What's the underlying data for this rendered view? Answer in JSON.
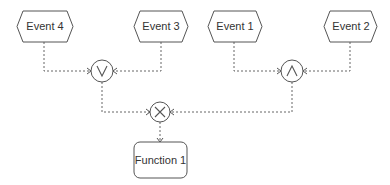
{
  "diagram": {
    "type": "EPC (Event-driven Process Chain)",
    "events": [
      {
        "id": "event4",
        "label": "Event 4"
      },
      {
        "id": "event3",
        "label": "Event 3"
      },
      {
        "id": "event1",
        "label": "Event 1"
      },
      {
        "id": "event2",
        "label": "Event 2"
      }
    ],
    "connectors": [
      {
        "id": "or",
        "symbol": "∨",
        "kind": "OR",
        "inputs": [
          "event4",
          "event3"
        ]
      },
      {
        "id": "and",
        "symbol": "∧",
        "kind": "AND",
        "inputs": [
          "event1",
          "event2"
        ]
      },
      {
        "id": "xor",
        "symbol": "×",
        "kind": "XOR",
        "inputs": [
          "or",
          "and"
        ]
      }
    ],
    "functions": [
      {
        "id": "function1",
        "label": "Function 1",
        "input": "xor"
      }
    ],
    "colors": {
      "stroke": "#555555",
      "connector_line": "#666666",
      "text": "#333333",
      "background": "#ffffff"
    }
  }
}
